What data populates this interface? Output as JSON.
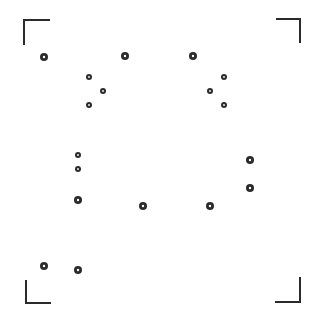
{
  "canvas": {
    "width": 316,
    "height": 322,
    "background": "#ffffff"
  },
  "colors": {
    "stroke": "#2b2b2b",
    "dot_fill": "#2b2b2b",
    "dot_center": "#ffffff"
  },
  "corner_brackets": [
    {
      "name": "top-left",
      "points": "50,20 24,20 24,45"
    },
    {
      "name": "top-right",
      "points": "276,19 300,19 300,43"
    },
    {
      "name": "bottom-left",
      "points": "26,280 26,303 51,303"
    },
    {
      "name": "bottom-right",
      "points": "300,277 300,302 275,302"
    }
  ],
  "dots": [
    {
      "x": 44,
      "y": 57,
      "r": 4
    },
    {
      "x": 125,
      "y": 56,
      "r": 4
    },
    {
      "x": 193,
      "y": 56,
      "r": 4
    },
    {
      "x": 89,
      "y": 77,
      "r": 3
    },
    {
      "x": 103,
      "y": 91,
      "r": 3
    },
    {
      "x": 89,
      "y": 105,
      "r": 3
    },
    {
      "x": 224,
      "y": 77,
      "r": 3
    },
    {
      "x": 210,
      "y": 91,
      "r": 3
    },
    {
      "x": 224,
      "y": 105,
      "r": 3
    },
    {
      "x": 78,
      "y": 155,
      "r": 3
    },
    {
      "x": 78,
      "y": 169,
      "r": 3
    },
    {
      "x": 78,
      "y": 200,
      "r": 4
    },
    {
      "x": 143,
      "y": 206,
      "r": 4
    },
    {
      "x": 210,
      "y": 206,
      "r": 4
    },
    {
      "x": 250,
      "y": 160,
      "r": 4
    },
    {
      "x": 250,
      "y": 188,
      "r": 4
    },
    {
      "x": 44,
      "y": 266,
      "r": 4
    },
    {
      "x": 78,
      "y": 270,
      "r": 4
    }
  ]
}
